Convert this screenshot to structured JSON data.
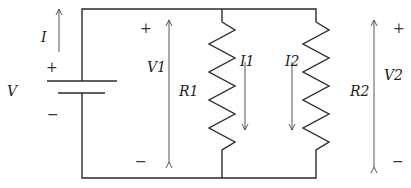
{
  "diagram": {
    "type": "parallel resistor circuit",
    "source": {
      "label": "V",
      "current_label": "I",
      "plus": "+",
      "minus": "−"
    },
    "branches": [
      {
        "resistor_label": "R1",
        "current_label": "I1",
        "voltage_label": "V1",
        "plus": "+",
        "minus": "−"
      },
      {
        "resistor_label": "R2",
        "current_label": "I2",
        "voltage_label": "V2",
        "plus": "+",
        "minus": "−"
      }
    ]
  }
}
